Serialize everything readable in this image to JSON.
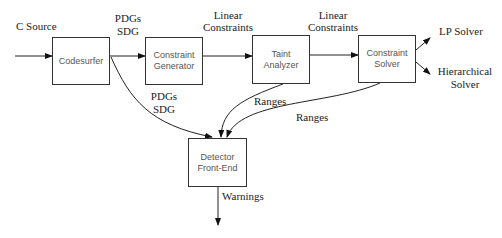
{
  "diagram": {
    "nodes": {
      "codesurfer": {
        "line1": "Codesurfer",
        "line2": ""
      },
      "constraint_generator": {
        "line1": "Constraint",
        "line2": "Generator"
      },
      "taint_analyzer": {
        "line1": "Taint",
        "line2": "Analyzer"
      },
      "constraint_solver": {
        "line1": "Constraint",
        "line2": "Solver"
      },
      "detector": {
        "line1": "Detector",
        "line2": "Front-End"
      }
    },
    "edge_labels": {
      "input": "C Source",
      "pdgs_top_1": "PDGs",
      "pdgs_top_2": "SDG",
      "linear1_1": "Linear",
      "linear1_2": "Constraints",
      "linear2_1": "Linear",
      "linear2_2": "Constraints",
      "lp_solver": "LP Solver",
      "hier_1": "Hierarchical",
      "hier_2": "Solver",
      "pdgs_bottom_1": "PDGs",
      "pdgs_bottom_2": "SDG",
      "ranges_taint": "Ranges",
      "ranges_solver": "Ranges",
      "warnings": "Warnings"
    }
  }
}
